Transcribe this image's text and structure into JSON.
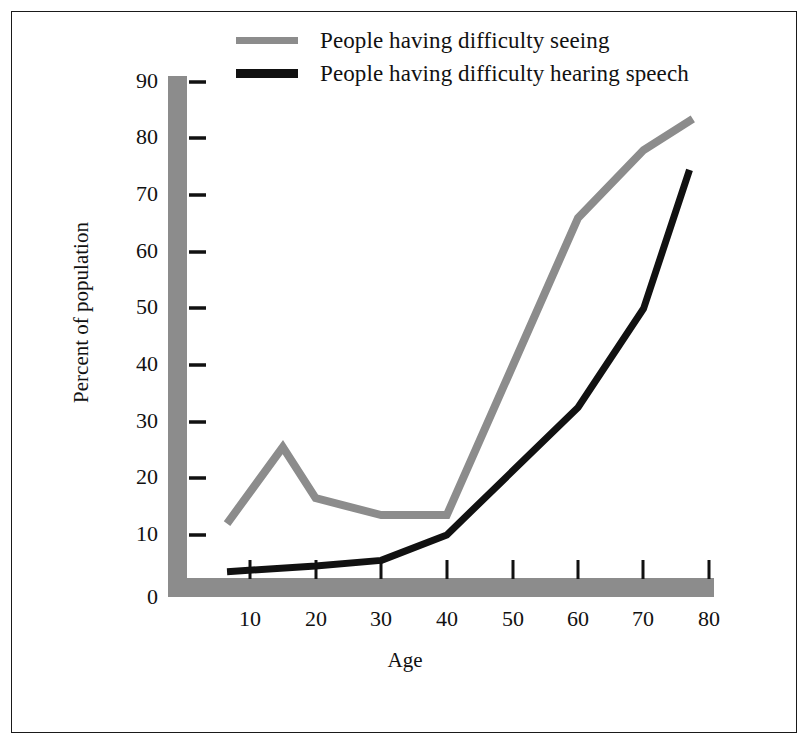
{
  "chart_data": {
    "type": "line",
    "title": "",
    "xlabel": "Age",
    "ylabel": "Percent of population",
    "xlim": [
      0,
      82
    ],
    "ylim": [
      0,
      90
    ],
    "xticks": [
      10,
      20,
      30,
      40,
      50,
      60,
      70,
      80
    ],
    "yticks": [
      0,
      10,
      20,
      30,
      40,
      50,
      60,
      70,
      80,
      90
    ],
    "grid": false,
    "legend_position": "top-center",
    "axis_color": "#8c8c8c",
    "series": [
      {
        "name": "People having difficulty seeing",
        "color": "#8c8c8c",
        "x": [
          6.5,
          15,
          20,
          30,
          40,
          60,
          70,
          77.5
        ],
        "values": [
          12,
          25.5,
          16.5,
          13.5,
          13.5,
          66,
          78,
          83.5
        ]
      },
      {
        "name": "People having difficulty hearing speech",
        "color": "#111111",
        "x": [
          6.5,
          20,
          30,
          40,
          60,
          70,
          77
        ],
        "values": [
          3.5,
          4.5,
          5.5,
          10,
          32.5,
          50,
          74.5
        ]
      }
    ]
  },
  "legend": {
    "items": [
      {
        "label": "People having difficulty seeing",
        "color": "#8c8c8c"
      },
      {
        "label": "People having difficulty hearing speech",
        "color": "#111111"
      }
    ]
  },
  "axes": {
    "x_title": "Age",
    "y_title": "Percent of population",
    "y_tick_labels": [
      "90",
      "80",
      "70",
      "60",
      "50",
      "40",
      "30",
      "20",
      "10",
      "0"
    ],
    "x_tick_labels": [
      "10",
      "20",
      "30",
      "40",
      "50",
      "60",
      "70",
      "80"
    ]
  }
}
